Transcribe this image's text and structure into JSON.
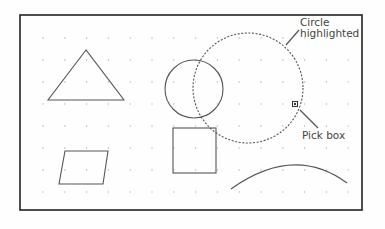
{
  "diagram": {
    "labels": {
      "circle_highlighted_line1": "Circle",
      "circle_highlighted_line2": "highlighted",
      "pick_box": "Pick box"
    },
    "grid": {
      "x_start": 43,
      "y_start": 38,
      "step_x": 21.8,
      "step_y": 22,
      "cols": 15,
      "rows": 8
    },
    "frame": {
      "x": 20,
      "y": 15,
      "width": 342,
      "height": 195
    },
    "colors": {
      "stroke": "#555555",
      "frame": "#222222",
      "dots": "#b5b5b5",
      "text": "#444444"
    },
    "shapes": [
      {
        "type": "triangle",
        "points": [
          [
            86,
            50
          ],
          [
            48,
            100
          ],
          [
            124,
            100
          ]
        ]
      },
      {
        "type": "circle",
        "cx": 194,
        "cy": 89,
        "r": 29,
        "style": "solid"
      },
      {
        "type": "circle",
        "cx": 248,
        "cy": 88,
        "r": 55,
        "style": "dashed",
        "highlighted": true
      },
      {
        "type": "square",
        "x": 173,
        "y": 128,
        "width": 43,
        "height": 45
      },
      {
        "type": "parallelogram",
        "points": [
          [
            65,
            151
          ],
          [
            108,
            151
          ],
          [
            103,
            184
          ],
          [
            59,
            184
          ]
        ]
      },
      {
        "type": "arc",
        "from": [
          231,
          189
        ],
        "control": [
          294,
          144
        ],
        "to": [
          347,
          183
        ]
      }
    ],
    "pick_box": {
      "x": 295,
      "y": 104,
      "size": 5
    },
    "leaders": [
      {
        "from": [
          286,
          45
        ],
        "to": [
          299,
          30
        ]
      },
      {
        "from": [
          300,
          110
        ],
        "to": [
          318,
          128
        ]
      }
    ]
  }
}
